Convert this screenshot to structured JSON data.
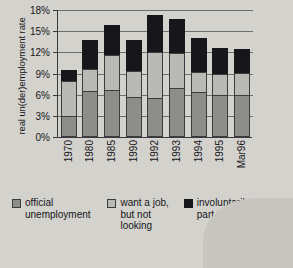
{
  "chart_data": {
    "type": "bar",
    "subtype": "stacked",
    "title": "",
    "xlabel": "",
    "ylabel": "real un(der)employment rate",
    "ylim": [
      0,
      18
    ],
    "ytick_labels": [
      "0%",
      "3%",
      "6%",
      "9%",
      "12%",
      "15%",
      "18%"
    ],
    "ytick_values": [
      0,
      3,
      6,
      9,
      12,
      15,
      18
    ],
    "grid": true,
    "legend_position": "bottom",
    "categories": [
      "1970",
      "1980",
      "1985",
      "1990",
      "1992",
      "1993",
      "1994",
      "1995",
      "Mar96"
    ],
    "series": [
      {
        "name": "official unemployment",
        "color": "#8d8d8a",
        "values": [
          3.0,
          6.5,
          6.6,
          5.7,
          5.5,
          6.9,
          6.4,
          5.9,
          5.9
        ]
      },
      {
        "name": "want a job, but not looking",
        "color": "#b9b9b5",
        "values": [
          5.0,
          3.2,
          5.0,
          3.6,
          6.5,
          5.0,
          2.8,
          3.0,
          3.2
        ]
      },
      {
        "name": "involuntarily part-time",
        "color": "#17171b",
        "values": [
          1.5,
          4.0,
          4.3,
          4.4,
          5.3,
          4.9,
          4.8,
          3.7,
          3.4
        ]
      }
    ],
    "totals": [
      9.5,
      13.7,
      15.9,
      13.7,
      17.3,
      16.8,
      14.0,
      12.6,
      12.5
    ]
  },
  "axis": {
    "y_title": "real un(der)employment rate"
  },
  "legend": {
    "items": [
      {
        "label": "official unemployment",
        "color": "#8d8d8a"
      },
      {
        "label": "want a job, but not looking",
        "color": "#b9b9b5"
      },
      {
        "label": "involuntarily part-time",
        "color": "#17171b"
      }
    ]
  }
}
